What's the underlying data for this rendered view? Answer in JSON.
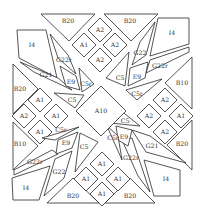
{
  "diagram": {
    "type": "quilt-block-pattern",
    "background": "#ffffff",
    "line_color": "#2a2a2a",
    "center": {
      "label": "A10"
    },
    "pieces": [
      {
        "id": "b20-top-left",
        "label": "B20",
        "shape": "triangle"
      },
      {
        "id": "b20-top-right",
        "label": "B20",
        "shape": "triangle"
      },
      {
        "id": "a-top-1",
        "label": "A2",
        "shape": "diamond"
      },
      {
        "id": "a-top-2",
        "label": "A1",
        "shape": "diamond"
      },
      {
        "id": "a-top-3",
        "label": "A2",
        "shape": "diamond"
      },
      {
        "id": "a-top-4",
        "label": "A2",
        "shape": "diamond"
      },
      {
        "id": "i4-top-left",
        "label": "I4",
        "shape": "pentagon"
      },
      {
        "id": "g22r-top-left",
        "label": "G22r",
        "shape": "parallelogram"
      },
      {
        "id": "g21-top-left",
        "label": "G21",
        "shape": "parallelogram"
      },
      {
        "id": "e9-top-left",
        "label": "E9",
        "shape": "parallelogram"
      },
      {
        "id": "c5r-top-left",
        "label": "C5r",
        "shape": "triangle"
      },
      {
        "id": "c5-top-left",
        "label": "C5",
        "shape": "triangle"
      },
      {
        "id": "i4-top-right",
        "label": "I4",
        "shape": "pentagon"
      },
      {
        "id": "g22-top-right",
        "label": "G22",
        "shape": "parallelogram"
      },
      {
        "id": "g22r-top-right",
        "label": "G22r",
        "shape": "parallelogram"
      },
      {
        "id": "e9-top-right",
        "label": "E9",
        "shape": "parallelogram"
      },
      {
        "id": "c5-top-right",
        "label": "C5",
        "shape": "triangle"
      },
      {
        "id": "c5r-top-right",
        "label": "C5r",
        "shape": "triangle"
      },
      {
        "id": "b20-left-top",
        "label": "B20",
        "shape": "triangle"
      },
      {
        "id": "b20-left-bottom",
        "label": "B10",
        "shape": "triangle"
      },
      {
        "id": "a-left-1",
        "label": "A1",
        "shape": "diamond"
      },
      {
        "id": "a-left-2",
        "label": "A2",
        "shape": "diamond"
      },
      {
        "id": "a-left-3",
        "label": "A1",
        "shape": "diamond"
      },
      {
        "id": "a-left-4",
        "label": "A1",
        "shape": "diamond"
      },
      {
        "id": "b10-right-top",
        "label": "B10",
        "shape": "triangle"
      },
      {
        "id": "b20-right-bottom",
        "label": "B20",
        "shape": "triangle"
      },
      {
        "id": "a-right-1",
        "label": "A2",
        "shape": "diamond"
      },
      {
        "id": "a-right-2",
        "label": "A2",
        "shape": "diamond"
      },
      {
        "id": "a-right-3",
        "label": "A1",
        "shape": "diamond"
      },
      {
        "id": "a-right-4",
        "label": "A2",
        "shape": "diamond"
      },
      {
        "id": "i4-bottom-left",
        "label": "I4",
        "shape": "pentagon"
      },
      {
        "id": "g22r-bottom-left",
        "label": "G22r",
        "shape": "parallelogram"
      },
      {
        "id": "g22-bottom-left",
        "label": "G22",
        "shape": "parallelogram"
      },
      {
        "id": "e9-bottom-left",
        "label": "E9",
        "shape": "parallelogram"
      },
      {
        "id": "c5r-bottom-left",
        "label": "C5r",
        "shape": "triangle"
      },
      {
        "id": "c5-bottom-left",
        "label": "C5",
        "shape": "triangle"
      },
      {
        "id": "i4-bottom-right",
        "label": "I4",
        "shape": "pentagon"
      },
      {
        "id": "g21-bottom-right",
        "label": "G21",
        "shape": "parallelogram"
      },
      {
        "id": "g22r-bottom-right",
        "label": "G22r",
        "shape": "parallelogram"
      },
      {
        "id": "e9-bottom-right",
        "label": "E9",
        "shape": "parallelogram"
      },
      {
        "id": "c5-bottom-right",
        "label": "C5",
        "shape": "triangle"
      },
      {
        "id": "c5r-bottom-right",
        "label": "C5r",
        "shape": "triangle"
      },
      {
        "id": "b20-bottom-left",
        "label": "B20",
        "shape": "triangle"
      },
      {
        "id": "b20-bottom-right",
        "label": "B20",
        "shape": "triangle"
      },
      {
        "id": "a-bottom-1",
        "label": "A1",
        "shape": "diamond"
      },
      {
        "id": "a-bottom-2",
        "label": "A1",
        "shape": "diamond"
      },
      {
        "id": "a-bottom-3",
        "label": "A1",
        "shape": "diamond"
      },
      {
        "id": "a-bottom-4",
        "label": "A1",
        "shape": "diamond"
      },
      {
        "id": "a10-center",
        "label": "A10",
        "shape": "square"
      }
    ]
  }
}
